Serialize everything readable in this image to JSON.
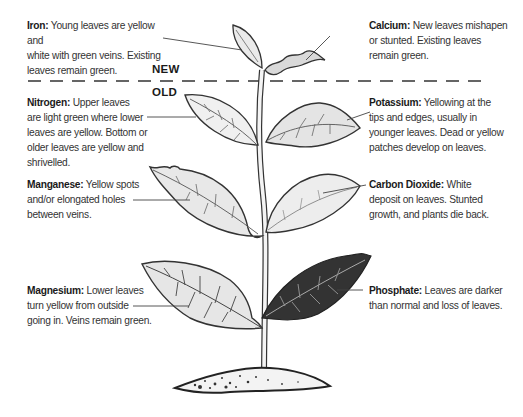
{
  "markers": {
    "new": "NEW",
    "old": "OLD"
  },
  "notes": {
    "iron": {
      "title": "Iron:",
      "lines": [
        "Young leaves are yellow and",
        "white with green veins. Existing",
        "leaves remain green."
      ]
    },
    "calcium": {
      "title": "Calcium:",
      "lines": [
        "New leaves mishapen",
        "or stunted. Existing leaves",
        "remain green."
      ]
    },
    "nitrogen": {
      "title": "Nitrogen:",
      "lines": [
        "Upper leaves",
        "are light green where lower",
        "leaves are yellow. Bottom or",
        "older leaves are yellow and shrivelled."
      ]
    },
    "potassium": {
      "title": "Potassium:",
      "lines": [
        "Yellowing at the",
        "tips and edges, usually in",
        "younger leaves. Dead or yellow",
        "patches develop on leaves."
      ]
    },
    "manganese": {
      "title": "Manganese:",
      "lines": [
        "Yellow spots",
        "and/or elongated holes",
        "between veins."
      ]
    },
    "carbon_dioxide": {
      "title": "Carbon Dioxide:",
      "lines": [
        "White",
        "deposit on leaves. Stunted",
        "growth, and plants die back."
      ]
    },
    "magnesium": {
      "title": "Magnesium:",
      "lines": [
        "Lower leaves",
        "turn yellow from outside",
        "going in. Veins remain green."
      ]
    },
    "phosphate": {
      "title": "Phosphate:",
      "lines": [
        "Leaves are darker",
        "than normal and loss of leaves."
      ]
    }
  },
  "colors": {
    "ink": "#2b2b2b",
    "leaf_light": "#e6e6e6",
    "leaf_dark": "#333333",
    "soil": "#f2f2f2"
  }
}
